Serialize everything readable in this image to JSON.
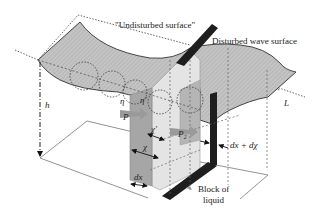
{
  "diagram": {
    "type": "3d-schematic",
    "labels": {
      "undisturbed_surface": "\"Undisturbed surface\"",
      "disturbed_wave_surface": "Disturbed wave surface",
      "depth": "h",
      "width": "L",
      "eta": "η",
      "eta_prime": "η'",
      "pressure_1": "P",
      "pressure_2": "P₂",
      "chi_prime": "χ'",
      "chi": "χ",
      "dx": "dx",
      "dx_dchi": "dx + dχ",
      "block_line1": "Block of",
      "block_line2": "liquid"
    },
    "colors": {
      "surface_fill": "#c8c8c8",
      "slab_left": "#a9a9a9",
      "slab_light": "#e6e6e6",
      "dark_band": "#1e1e1e",
      "arrow_pressure": "#9a9a9a",
      "lines": "#444444"
    }
  }
}
